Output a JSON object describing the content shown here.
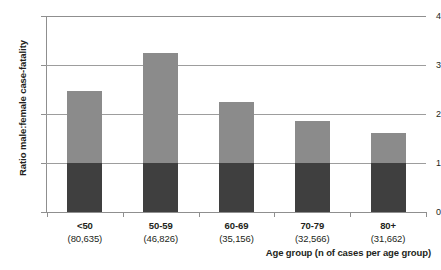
{
  "chart_data": {
    "type": "bar",
    "title": "",
    "xlabel": "Age group (n of cases per age group)",
    "ylabel": "Ratio male:female case-fatality",
    "categories": [
      "<50",
      "50-59",
      "60-69",
      "70-79",
      "80+"
    ],
    "category_counts": [
      "(80,635)",
      "(46,826)",
      "(35,156)",
      "(32,566)",
      "(31,662)"
    ],
    "values": [
      2.47,
      3.24,
      2.24,
      1.86,
      1.61
    ],
    "ylim": [
      0,
      4
    ],
    "yticks": [
      0,
      1,
      2,
      3,
      4
    ],
    "ytick_labels": [
      "0",
      "1",
      "2",
      "3",
      "4"
    ],
    "grid": true,
    "legend": "none",
    "reference_line": 1,
    "series": [
      {
        "name": "Ratio male:female case-fatality",
        "values": [
          2.47,
          3.24,
          2.24,
          1.86,
          1.61
        ]
      }
    ],
    "colors": {
      "bar_above_reference": "#8b8b8b",
      "bar_below_reference": "#3f3f3f",
      "gridline": "#9d9d9d",
      "axis": "#8f8f8f",
      "text": "#231f20"
    }
  }
}
